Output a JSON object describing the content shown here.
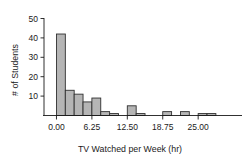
{
  "chart_data": {
    "type": "bar",
    "title": "",
    "xlabel": "TV Watched per Week (hr)",
    "ylabel": "# of Students",
    "xlim": [
      -2.2,
      31.5
    ],
    "ylim": [
      0,
      50
    ],
    "xticks": [
      "0.00",
      "6.25",
      "12.50",
      "18.75",
      "25.00"
    ],
    "xtick_values": [
      0,
      6.25,
      12.5,
      18.75,
      25
    ],
    "yticks": [
      "10",
      "20",
      "30",
      "40",
      "50"
    ],
    "ytick_values": [
      10,
      20,
      30,
      40,
      50
    ],
    "grid": false,
    "legend": "none",
    "bin_width": 1.5625,
    "bin_starts": [
      0,
      1.5625,
      3.125,
      4.6875,
      6.25,
      7.8125,
      9.375,
      12.5,
      14.0625,
      18.75,
      21.875,
      25,
      26.5625
    ],
    "categories": [
      "0.00-1.56",
      "1.56-3.13",
      "3.13-4.69",
      "4.69-6.25",
      "6.25-7.81",
      "7.81-9.38",
      "9.38-10.94",
      "12.50-14.06",
      "14.06-15.63",
      "18.75-20.31",
      "21.88-23.44",
      "25.00-26.56",
      "26.56-28.13"
    ],
    "values": [
      42,
      13,
      11,
      7,
      9,
      2,
      1,
      5,
      1,
      2,
      2,
      1,
      1
    ],
    "bar_fill": "#b5b5b5",
    "bar_stroke": "#303030",
    "axis_color": "#1a1a1a"
  },
  "axes": {
    "x_title": "TV Watched per Week (hr)",
    "y_title": "# of Students"
  }
}
